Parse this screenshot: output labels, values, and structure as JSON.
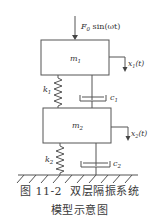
{
  "figure": {
    "caption_number": "图 11-2",
    "caption_line1": "双层隔振系统",
    "caption_line2": "模型示意图"
  },
  "labels": {
    "force": "F",
    "force_sub": "0",
    "force_rest": " sin(ωt)",
    "mass1": "m",
    "mass1_sub": "1",
    "mass2": "m",
    "mass2_sub": "2",
    "spring1": "k",
    "spring1_sub": "1",
    "spring2": "k",
    "spring2_sub": "2",
    "damper1": "c",
    "damper1_sub": "1",
    "damper2": "c",
    "damper2_sub": "2",
    "disp1": "x",
    "disp1_sub": "1",
    "disp1_rest": "(t)",
    "disp2": "x",
    "disp2_sub": "2",
    "disp2_rest": "(t)"
  },
  "colors": {
    "stroke": "#555555",
    "text": "#333333",
    "background": "#ffffff"
  }
}
